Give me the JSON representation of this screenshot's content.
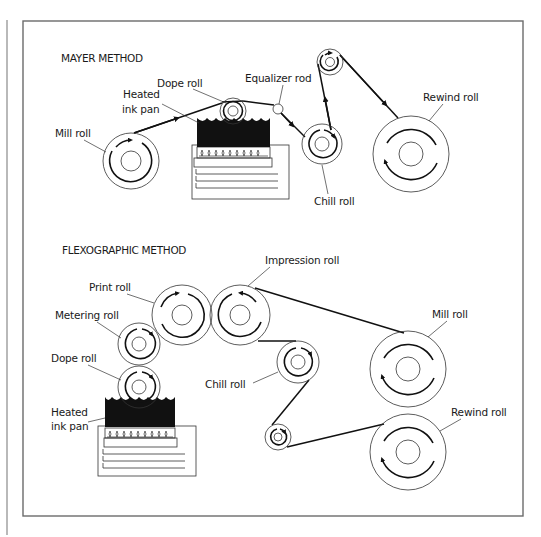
{
  "figure": {
    "frame_color": "#6b6b6b",
    "ink_color": "#111111"
  },
  "mayer": {
    "title": "MAYER METHOD",
    "labels": {
      "dope_roll": "Dope roll",
      "equalizer_rod": "Equalizer rod",
      "heated_ink_pan_line1": "Heated",
      "heated_ink_pan_line2": "ink pan",
      "mill_roll": "Mill roll",
      "chill_roll": "Chill roll",
      "rewind_roll": "Rewind roll"
    }
  },
  "flexographic": {
    "title": "FLEXOGRAPHIC METHOD",
    "labels": {
      "impression_roll": "Impression roll",
      "print_roll": "Print roll",
      "metering_roll": "Metering roll",
      "dope_roll": "Dope roll",
      "heated_ink_pan_line1": "Heated",
      "heated_ink_pan_line2": "ink pan",
      "chill_roll": "Chill roll",
      "mill_roll": "Mill roll",
      "rewind_roll": "Rewind roll"
    }
  }
}
